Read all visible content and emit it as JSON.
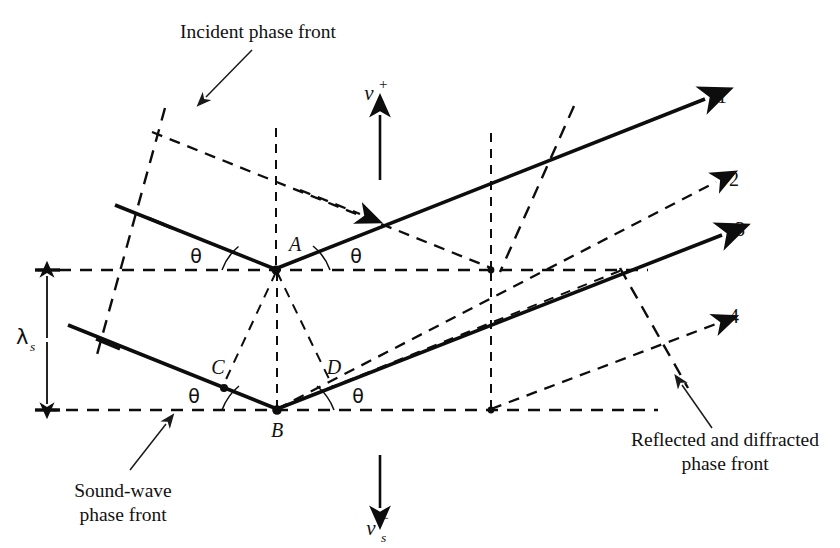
{
  "figure": {
    "background_color": "#ffffff",
    "ink_color": "#0d0d0d"
  },
  "callouts": {
    "incident": {
      "line1": "Incident phase front",
      "line2": ""
    },
    "soundwave": {
      "line1": "Sound-wave",
      "line2": "phase front"
    },
    "reflected": {
      "line1": "Reflected and diffracted",
      "line2": "phase front"
    }
  },
  "points": {
    "a": "A",
    "b": "B",
    "c": "C",
    "d": "D"
  },
  "angles": {
    "upper_left": "θ",
    "upper_right": "θ",
    "lower_left": "θ",
    "lower_right": "θ"
  },
  "rays": {
    "out1": "1",
    "out2": "2",
    "out3": "3",
    "out4": "4"
  },
  "velocity": {
    "up": {
      "base": "v",
      "sup": "+",
      "sub": "s"
    },
    "down": {
      "base": "v",
      "sup": "−",
      "sub": "s"
    }
  },
  "wavelength": {
    "base": "λ",
    "sub": "s"
  }
}
